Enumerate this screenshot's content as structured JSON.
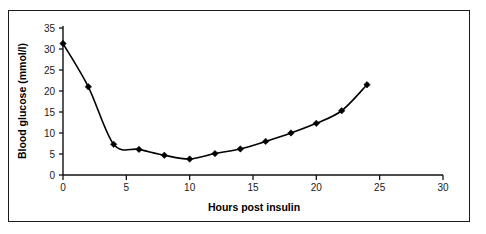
{
  "figure": {
    "border_color": "#1a1a1a",
    "background": "#ffffff"
  },
  "chart_data": {
    "type": "line",
    "title": "",
    "xlabel": "Hours post insulin",
    "ylabel": "Blood glucose (mmol/l)",
    "xlim": [
      0,
      30
    ],
    "ylim": [
      0,
      35
    ],
    "xticks": [
      0,
      5,
      10,
      15,
      20,
      25,
      30
    ],
    "xtick_labels": [
      "0",
      "5",
      "10",
      "15",
      "20",
      "25",
      "30"
    ],
    "yticks": [
      0,
      5,
      10,
      15,
      20,
      25,
      30,
      35
    ],
    "ytick_labels": [
      "0",
      "5",
      "10",
      "15",
      "20",
      "25",
      "30",
      "35"
    ],
    "grid": false,
    "legend": false,
    "marker": "diamond",
    "line_color": "#000000",
    "marker_color": "#000000",
    "x": [
      0,
      2,
      4,
      6,
      8,
      10,
      12,
      14,
      16,
      18,
      20,
      22,
      24
    ],
    "values": [
      31.3,
      21.0,
      7.3,
      6.1,
      4.7,
      3.8,
      5.1,
      6.2,
      8.0,
      10.0,
      12.3,
      15.3,
      21.5
    ],
    "series": [
      {
        "name": "Blood glucose",
        "x": [
          0,
          2,
          4,
          6,
          8,
          10,
          12,
          14,
          16,
          18,
          20,
          22,
          24
        ],
        "values": [
          31.3,
          21.0,
          7.3,
          6.1,
          4.7,
          3.8,
          5.1,
          6.2,
          8.0,
          10.0,
          12.3,
          15.3,
          21.5
        ]
      }
    ]
  }
}
